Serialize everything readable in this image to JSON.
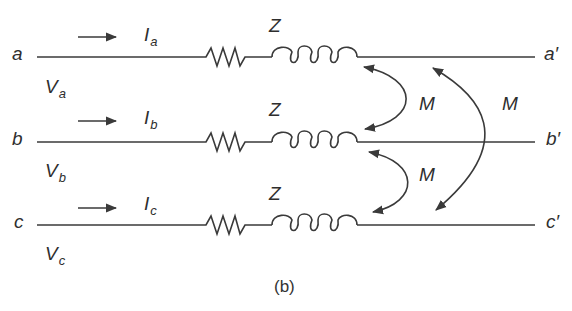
{
  "caption": "(b)",
  "lines": [
    {
      "id": "a",
      "start_label": "a",
      "end_label": "a′",
      "voltage": {
        "symbol": "V",
        "sub": "a"
      },
      "current": {
        "symbol": "I",
        "sub": "a"
      },
      "impedance": "Z"
    },
    {
      "id": "b",
      "start_label": "b",
      "end_label": "b′",
      "voltage": {
        "symbol": "V",
        "sub": "b"
      },
      "current": {
        "symbol": "I",
        "sub": "b"
      },
      "impedance": "Z"
    },
    {
      "id": "c",
      "start_label": "c",
      "end_label": "c′",
      "voltage": {
        "symbol": "V",
        "sub": "c"
      },
      "current": {
        "symbol": "I",
        "sub": "c"
      },
      "impedance": "Z"
    }
  ],
  "mutual": [
    {
      "between": "a-b",
      "label": "M"
    },
    {
      "between": "b-c",
      "label": "M"
    },
    {
      "between": "a-c",
      "label": "M"
    }
  ],
  "colors": {
    "stroke": "#3a3a3a",
    "text": "#2e2e2e"
  }
}
